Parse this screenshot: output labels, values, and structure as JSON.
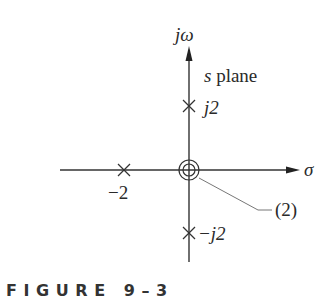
{
  "diagram": {
    "type": "pole-zero plot",
    "plane_label": "s plane",
    "axes": {
      "vertical_label": "jω",
      "horizontal_label": "σ"
    },
    "poles": [
      {
        "label": "j2",
        "re": 0,
        "im": 2
      },
      {
        "label": "−j2",
        "re": 0,
        "im": -2
      },
      {
        "label": "−2",
        "re": -2,
        "im": 0
      }
    ],
    "zeros": [
      {
        "label": "(2)",
        "re": 0,
        "im": 0,
        "multiplicity": 2
      }
    ],
    "labels": {
      "pole_pos_imag": "j2",
      "pole_neg_imag": "−j2",
      "pole_real": "−2",
      "zero_multiplicity": "(2)"
    },
    "colors": {
      "line": "#333333",
      "leader": "#777777"
    }
  },
  "caption": {
    "text": "F I G U R E   9 – 3"
  }
}
